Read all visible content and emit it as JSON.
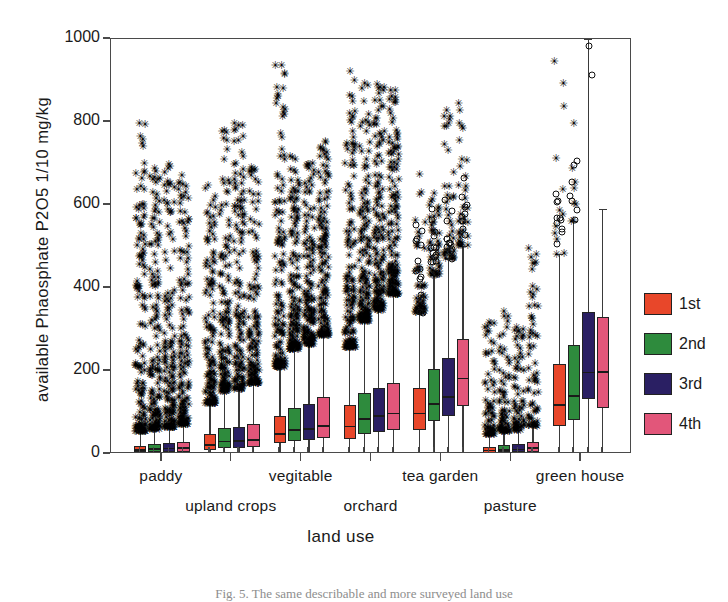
{
  "chart_data": {
    "type": "box",
    "title": "",
    "xlabel": "land use",
    "ylabel": "available Phaosphate P2O5  1/10 mg/kg",
    "ylim": [
      0,
      1000
    ],
    "yticks": [
      0,
      200,
      400,
      600,
      800,
      1000
    ],
    "grid": false,
    "legend_position": "right",
    "legend": [
      {
        "label": "1st",
        "color": "#e8472a"
      },
      {
        "label": "2nd",
        "color": "#2e8b3d"
      },
      {
        "label": "3rd",
        "color": "#2a1f63"
      },
      {
        "label": "4th",
        "color": "#e2567a"
      }
    ],
    "categories": [
      "paddy",
      "upland crops",
      "vegitable",
      "orchard",
      "tea garden",
      "pasture",
      "green house"
    ],
    "series_names": [
      "1st",
      "2nd",
      "3rd",
      "4th"
    ],
    "boxes": [
      {
        "group": "paddy",
        "series": "1st",
        "whisker_low": 0,
        "q1": 4,
        "median": 9,
        "q3": 20,
        "whisker_high": 52,
        "n_star_outliers": 150,
        "outlier_max": 810
      },
      {
        "group": "paddy",
        "series": "2nd",
        "whisker_low": 0,
        "q1": 5,
        "median": 12,
        "q3": 24,
        "whisker_high": 58,
        "n_star_outliers": 150,
        "outlier_max": 690
      },
      {
        "group": "paddy",
        "series": "3rd",
        "whisker_low": 0,
        "q1": 5,
        "median": 13,
        "q3": 26,
        "whisker_high": 62,
        "n_star_outliers": 150,
        "outlier_max": 700
      },
      {
        "group": "paddy",
        "series": "4th",
        "whisker_low": 0,
        "q1": 6,
        "median": 15,
        "q3": 30,
        "whisker_high": 70,
        "n_star_outliers": 150,
        "outlier_max": 700
      },
      {
        "group": "upland crops",
        "series": "1st",
        "whisker_low": 0,
        "q1": 10,
        "median": 22,
        "q3": 48,
        "whisker_high": 120,
        "n_star_outliers": 140,
        "outlier_max": 660
      },
      {
        "group": "upland crops",
        "series": "2nd",
        "whisker_low": 0,
        "q1": 14,
        "median": 30,
        "q3": 62,
        "whisker_high": 150,
        "n_star_outliers": 140,
        "outlier_max": 780
      },
      {
        "group": "upland crops",
        "series": "3rd",
        "whisker_low": 0,
        "q1": 14,
        "median": 31,
        "q3": 64,
        "whisker_high": 155,
        "n_star_outliers": 140,
        "outlier_max": 800
      },
      {
        "group": "upland crops",
        "series": "4th",
        "whisker_low": 0,
        "q1": 16,
        "median": 34,
        "q3": 72,
        "whisker_high": 168,
        "n_star_outliers": 140,
        "outlier_max": 700
      },
      {
        "group": "vegitable",
        "series": "1st",
        "whisker_low": 0,
        "q1": 26,
        "median": 48,
        "q3": 92,
        "whisker_high": 208,
        "n_star_outliers": 150,
        "outlier_max": 945
      },
      {
        "group": "vegitable",
        "series": "2nd",
        "whisker_low": 0,
        "q1": 32,
        "median": 58,
        "q3": 112,
        "whisker_high": 250,
        "n_star_outliers": 150,
        "outlier_max": 720
      },
      {
        "group": "vegitable",
        "series": "3rd",
        "whisker_low": 0,
        "q1": 34,
        "median": 60,
        "q3": 120,
        "whisker_high": 262,
        "n_star_outliers": 150,
        "outlier_max": 700
      },
      {
        "group": "vegitable",
        "series": "4th",
        "whisker_low": 0,
        "q1": 38,
        "median": 68,
        "q3": 138,
        "whisker_high": 285,
        "n_star_outliers": 150,
        "outlier_max": 760
      },
      {
        "group": "orchard",
        "series": "1st",
        "whisker_low": 0,
        "q1": 36,
        "median": 66,
        "q3": 118,
        "whisker_high": 255,
        "n_star_outliers": 155,
        "outlier_max": 940
      },
      {
        "group": "orchard",
        "series": "2nd",
        "whisker_low": 0,
        "q1": 48,
        "median": 84,
        "q3": 148,
        "whisker_high": 318,
        "n_star_outliers": 155,
        "outlier_max": 905
      },
      {
        "group": "orchard",
        "series": "3rd",
        "whisker_low": 0,
        "q1": 52,
        "median": 92,
        "q3": 158,
        "whisker_high": 345,
        "n_star_outliers": 155,
        "outlier_max": 890
      },
      {
        "group": "orchard",
        "series": "4th",
        "whisker_low": 0,
        "q1": 58,
        "median": 98,
        "q3": 172,
        "whisker_high": 382,
        "n_star_outliers": 155,
        "outlier_max": 880
      },
      {
        "group": "tea garden",
        "series": "1st",
        "whisker_low": 0,
        "q1": 58,
        "median": 98,
        "q3": 160,
        "whisker_high": 340,
        "n_star_outliers": 55,
        "outlier_max": 700,
        "n_circle_outliers": 14,
        "circle_max": 560
      },
      {
        "group": "tea garden",
        "series": "2nd",
        "whisker_low": 0,
        "q1": 80,
        "median": 120,
        "q3": 205,
        "whisker_high": 430,
        "n_star_outliers": 45,
        "outlier_max": 640,
        "n_circle_outliers": 14,
        "circle_max": 605
      },
      {
        "group": "tea garden",
        "series": "3rd",
        "whisker_low": 0,
        "q1": 92,
        "median": 138,
        "q3": 232,
        "whisker_high": 470,
        "n_star_outliers": 40,
        "outlier_max": 830,
        "n_circle_outliers": 12,
        "circle_max": 625
      },
      {
        "group": "tea garden",
        "series": "4th",
        "whisker_low": 0,
        "q1": 115,
        "median": 182,
        "q3": 278,
        "whisker_high": 500,
        "n_star_outliers": 35,
        "outlier_max": 845,
        "n_circle_outliers": 10,
        "circle_max": 760
      },
      {
        "group": "pasture",
        "series": "1st",
        "whisker_low": 0,
        "q1": 3,
        "median": 8,
        "q3": 18,
        "whisker_high": 45,
        "n_star_outliers": 75,
        "outlier_max": 330
      },
      {
        "group": "pasture",
        "series": "2nd",
        "whisker_low": 0,
        "q1": 4,
        "median": 10,
        "q3": 22,
        "whisker_high": 52,
        "n_star_outliers": 75,
        "outlier_max": 345
      },
      {
        "group": "pasture",
        "series": "3rd",
        "whisker_low": 0,
        "q1": 4,
        "median": 11,
        "q3": 24,
        "whisker_high": 56,
        "n_star_outliers": 70,
        "outlier_max": 330
      },
      {
        "group": "pasture",
        "series": "4th",
        "whisker_low": 0,
        "q1": 6,
        "median": 14,
        "q3": 30,
        "whisker_high": 66,
        "n_star_outliers": 70,
        "outlier_max": 540
      },
      {
        "group": "green house",
        "series": "1st",
        "whisker_low": 0,
        "q1": 68,
        "median": 118,
        "q3": 218,
        "whisker_high": 480,
        "n_star_outliers": 12,
        "outlier_max": 950,
        "n_circle_outliers": 10,
        "circle_max": 680
      },
      {
        "group": "green house",
        "series": "2nd",
        "whisker_low": 0,
        "q1": 82,
        "median": 140,
        "q3": 262,
        "whisker_high": 560,
        "n_star_outliers": 8,
        "outlier_max": 960,
        "n_circle_outliers": 7,
        "circle_max": 726
      },
      {
        "group": "green house",
        "series": "3rd",
        "whisker_low": 0,
        "q1": 132,
        "median": 196,
        "q3": 342,
        "whisker_high": 1000,
        "n_star_outliers": 0,
        "outlier_max": 0,
        "n_circle_outliers": 2,
        "circle_max": 905
      },
      {
        "group": "green house",
        "series": "4th",
        "whisker_low": 0,
        "q1": 110,
        "median": 198,
        "q3": 330,
        "whisker_high": 590,
        "n_star_outliers": 0,
        "outlier_max": 0,
        "n_circle_outliers": 0,
        "circle_max": 0
      }
    ]
  },
  "axes": {
    "ylabel": "available Phaosphate P2O5  1/10 mg/kg",
    "xlabel": "land use",
    "ytick_labels": [
      "1000",
      "800",
      "600",
      "400",
      "200",
      "0"
    ],
    "xtick_labels_row1": [
      "paddy",
      "vegitable",
      "tea garden",
      "green house"
    ],
    "xtick_labels_row2": [
      "upland crops",
      "orchard",
      "pasture"
    ]
  },
  "legend": {
    "items": [
      {
        "label": "1st",
        "color": "#e8472a"
      },
      {
        "label": "2nd",
        "color": "#2e8b3d"
      },
      {
        "label": "3rd",
        "color": "#2a1f63"
      },
      {
        "label": "4th",
        "color": "#e2567a"
      }
    ]
  },
  "caption": "Fig. 5.  The same describable and more surveyed land use"
}
